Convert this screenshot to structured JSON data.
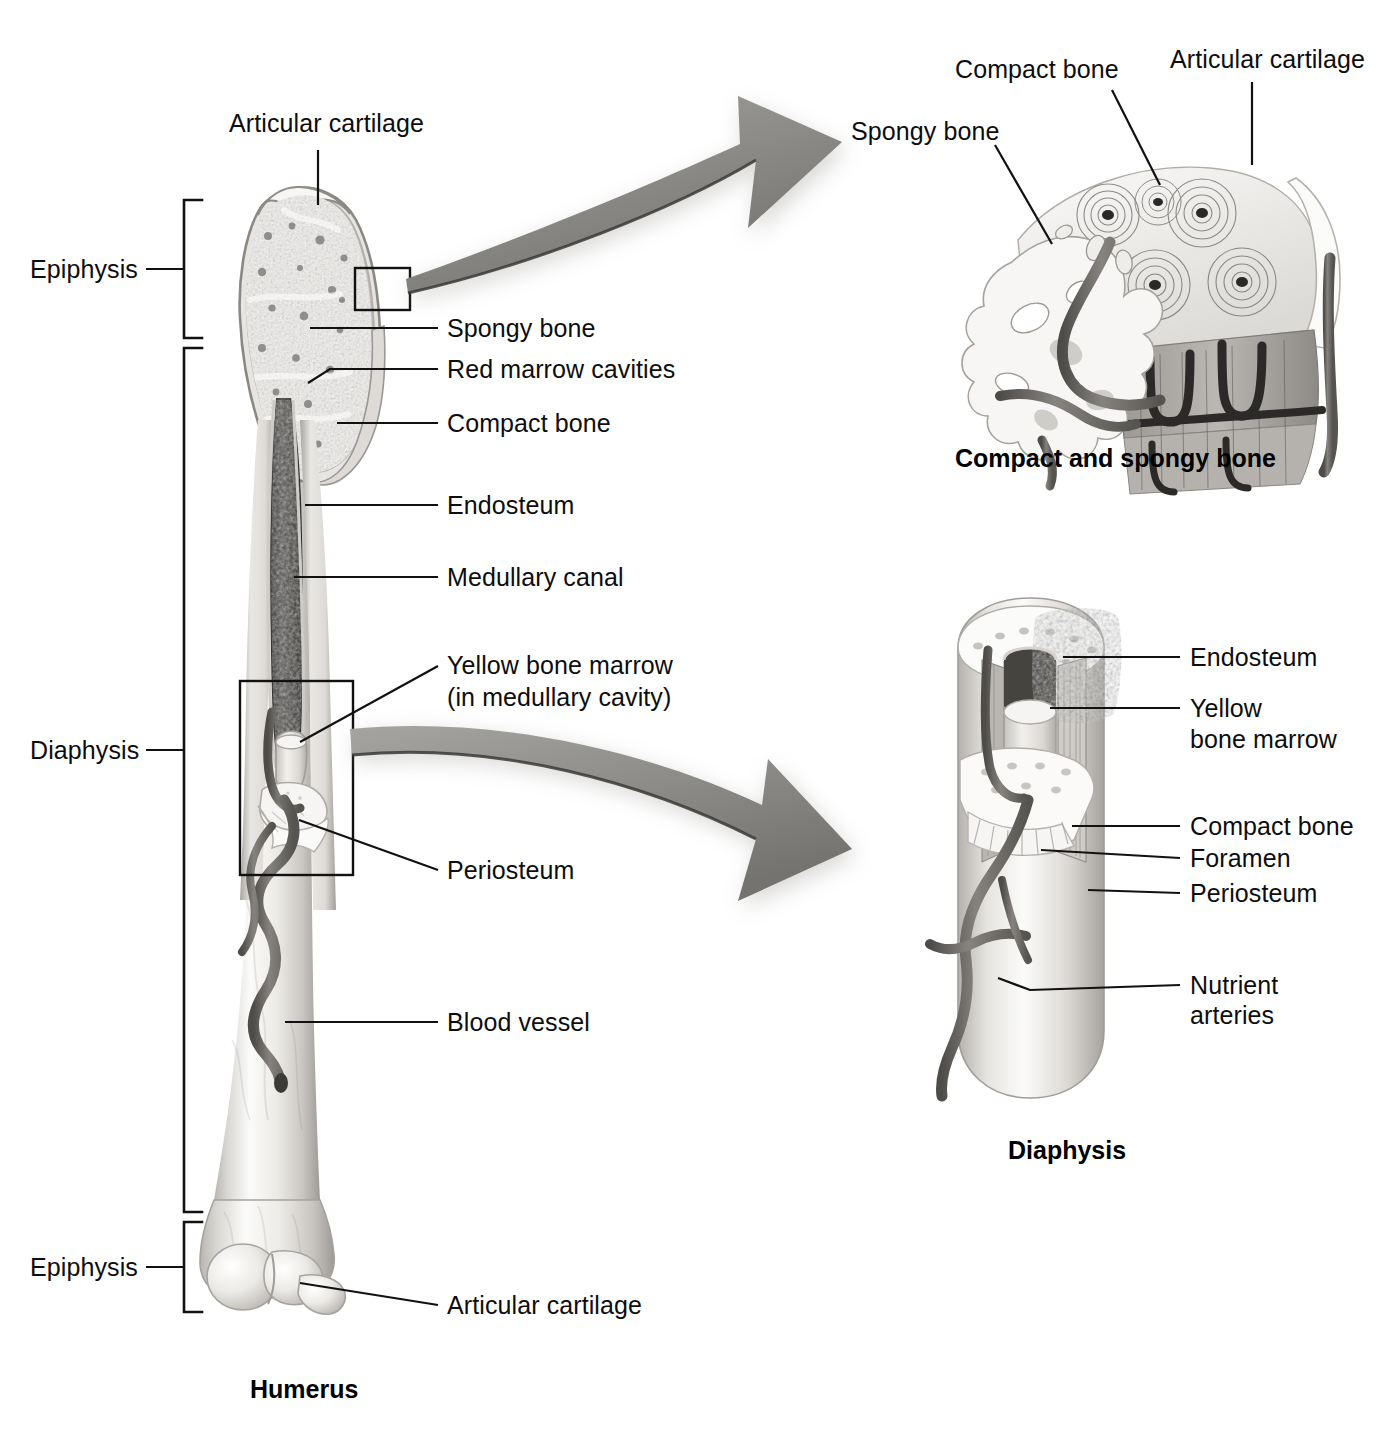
{
  "figure": {
    "title_main": "Humerus",
    "caption_top_inset": "Compact and spongy bone",
    "caption_bottom_inset": "Diaphysis"
  },
  "colors": {
    "line": "#111111",
    "text": "#0d0d0d",
    "bone_light": "#f4f3f1",
    "bone_mid": "#cfcdc9",
    "bone_dark": "#8e8b86",
    "marrow_dark": "#4a4946",
    "vessel": "#6f6d69",
    "arrow_gray": "#8f8d89",
    "background": "#ffffff"
  },
  "brackets": [
    {
      "label": "Epiphysis",
      "name": "bracket-epiphysis-proximal"
    },
    {
      "label": "Diaphysis",
      "name": "bracket-diaphysis"
    },
    {
      "label": "Epiphysis",
      "name": "bracket-epiphysis-distal"
    }
  ],
  "main_labels": [
    {
      "id": "articular-cartilage-top",
      "text": "Articular cartilage"
    },
    {
      "id": "spongy-bone",
      "text": "Spongy bone"
    },
    {
      "id": "red-marrow-cavities",
      "text": "Red marrow cavities"
    },
    {
      "id": "compact-bone",
      "text": "Compact bone"
    },
    {
      "id": "endosteum",
      "text": "Endosteum"
    },
    {
      "id": "medullary-canal",
      "text": "Medullary canal"
    },
    {
      "id": "yellow-bone-marrow-line1",
      "text": "Yellow bone marrow"
    },
    {
      "id": "yellow-bone-marrow-line2",
      "text": "(in medullary cavity)"
    },
    {
      "id": "periosteum",
      "text": "Periosteum"
    },
    {
      "id": "blood-vessel",
      "text": "Blood vessel"
    },
    {
      "id": "articular-cartilage-bottom",
      "text": "Articular cartilage"
    }
  ],
  "top_inset_labels": [
    {
      "id": "spongy-bone",
      "text": "Spongy bone"
    },
    {
      "id": "compact-bone",
      "text": "Compact bone"
    },
    {
      "id": "articular-cartilage",
      "text": "Articular cartilage"
    }
  ],
  "bottom_inset_labels": [
    {
      "id": "endosteum",
      "text": "Endosteum"
    },
    {
      "id": "yellow-bone-marrow-line1",
      "text": "Yellow"
    },
    {
      "id": "yellow-bone-marrow-line2",
      "text": "bone marrow"
    },
    {
      "id": "compact-bone",
      "text": "Compact bone"
    },
    {
      "id": "foramen",
      "text": "Foramen"
    },
    {
      "id": "periosteum",
      "text": "Periosteum"
    },
    {
      "id": "nutrient-arteries-line1",
      "text": "Nutrient"
    },
    {
      "id": "nutrient-arteries-line2",
      "text": "arteries"
    }
  ],
  "callout_boxes": [
    {
      "id": "epiphysis-detail-box",
      "note": "small box on proximal epiphysis feeding top inset"
    },
    {
      "id": "diaphysis-detail-box",
      "note": "tall box on shaft feeding bottom inset"
    }
  ]
}
